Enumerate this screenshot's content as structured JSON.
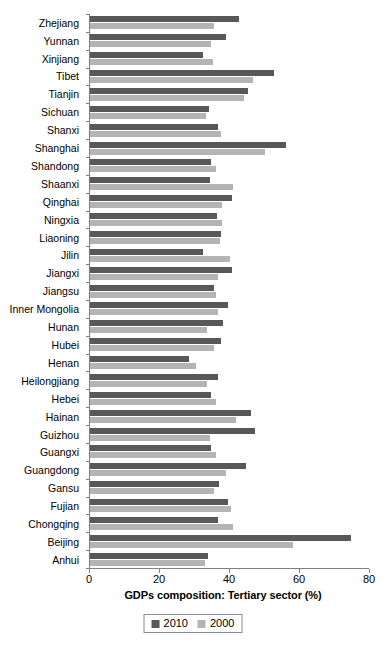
{
  "chart_data": {
    "type": "bar",
    "orientation": "horizontal",
    "title": "",
    "xlabel": "GDPs composition: Tertiary sector (%)",
    "ylabel": "",
    "xlim": [
      0,
      80
    ],
    "xticks": [
      0,
      20,
      40,
      60,
      80
    ],
    "grid": false,
    "legend_position": "bottom",
    "categories": [
      "Zhejiang",
      "Yunnan",
      "Xinjiang",
      "Tibet",
      "Tianjin",
      "Sichuan",
      "Shanxi",
      "Shanghai",
      "Shandong",
      "Shaanxi",
      "Qinghai",
      "Ningxia",
      "Liaoning",
      "Jilin",
      "Jiangxi",
      "Jiangsu",
      "Inner Mongolia",
      "Hunan",
      "Hubei",
      "Henan",
      "Heilongjiang",
      "Hebei",
      "Hainan",
      "Guizhou",
      "Guangxi",
      "Guangdong",
      "Gansu",
      "Fujian",
      "Chongqing",
      "Beijing",
      "Anhui"
    ],
    "series": [
      {
        "name": "2010",
        "color": "#585858",
        "values": [
          42.7,
          39.0,
          32.4,
          52.7,
          45.3,
          34.2,
          36.7,
          56.2,
          34.7,
          34.4,
          40.7,
          36.4,
          37.5,
          32.4,
          40.7,
          35.5,
          39.5,
          38.1,
          37.5,
          28.4,
          36.7,
          34.7,
          46.1,
          47.3,
          34.7,
          44.7,
          37.0,
          39.5,
          36.7,
          74.8,
          33.8
        ]
      },
      {
        "name": "2000",
        "color": "#b4b4b4",
        "values": [
          35.5,
          34.7,
          35.2,
          46.7,
          44.1,
          33.2,
          37.5,
          50.2,
          36.1,
          40.9,
          37.8,
          37.8,
          37.2,
          40.1,
          36.7,
          36.1,
          36.7,
          33.5,
          35.5,
          30.4,
          33.5,
          36.1,
          41.8,
          34.4,
          36.1,
          39.0,
          35.5,
          40.4,
          40.9,
          58.2,
          33.0
        ]
      }
    ]
  },
  "legend": {
    "items": [
      {
        "label": "2010",
        "color": "#585858"
      },
      {
        "label": "2000",
        "color": "#b4b4b4"
      }
    ]
  }
}
